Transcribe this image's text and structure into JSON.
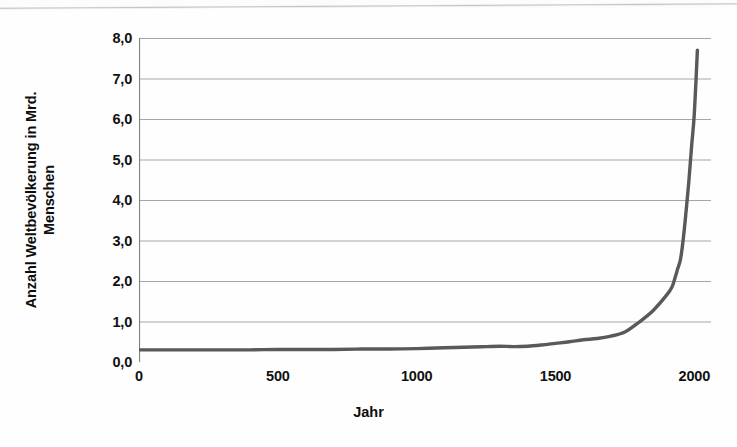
{
  "chart_data": {
    "type": "line",
    "title": "",
    "xlabel": "Jahr",
    "ylabel": "Anzahl Weltbevölkerung in Mrd. Menschen",
    "ylabel_lines": [
      "Anzahl Weltbevölkerung in Mrd.",
      "Menschen"
    ],
    "xlim": [
      0,
      2060
    ],
    "ylim": [
      0.0,
      8.0
    ],
    "grid": true,
    "legend": false,
    "series_color": "#595959",
    "grid_color": "#a6a6a6",
    "axis_color": "#808080",
    "x_ticks": [
      0,
      500,
      1000,
      1500,
      2000
    ],
    "x_tick_labels": [
      "0",
      "500",
      "1000",
      "1500",
      "2000"
    ],
    "y_ticks": [
      0.0,
      1.0,
      2.0,
      3.0,
      4.0,
      5.0,
      6.0,
      7.0,
      8.0
    ],
    "y_tick_labels": [
      "0,0",
      "1,0",
      "2,0",
      "3,0",
      "4,0",
      "5,0",
      "6,0",
      "7,0",
      "8,0"
    ],
    "series": [
      {
        "name": "Weltbevölkerung",
        "x": [
          0,
          100,
          200,
          300,
          400,
          500,
          600,
          700,
          800,
          900,
          1000,
          1100,
          1200,
          1250,
          1300,
          1350,
          1400,
          1450,
          1500,
          1550,
          1600,
          1650,
          1700,
          1750,
          1800,
          1850,
          1900,
          1920,
          1930,
          1940,
          1950,
          1960,
          1970,
          1980,
          1990,
          2000,
          2011
        ],
        "values": [
          0.3,
          0.3,
          0.3,
          0.3,
          0.3,
          0.31,
          0.31,
          0.31,
          0.32,
          0.32,
          0.33,
          0.35,
          0.37,
          0.38,
          0.39,
          0.38,
          0.39,
          0.42,
          0.46,
          0.5,
          0.55,
          0.58,
          0.64,
          0.74,
          0.98,
          1.26,
          1.65,
          1.86,
          2.07,
          2.3,
          2.53,
          3.03,
          3.7,
          4.44,
          5.32,
          6.14,
          7.7
        ]
      }
    ]
  },
  "axis": {
    "y_title_line1": "Anzahl Weltbevölkerung in Mrd.",
    "y_title_line2": "Menschen",
    "x_title": "Jahr"
  }
}
